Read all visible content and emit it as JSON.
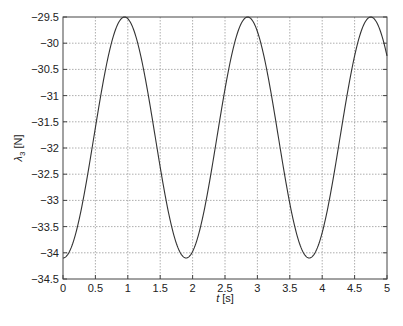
{
  "chart_data": {
    "type": "line",
    "title": "",
    "xlabel": "t [s]",
    "ylabel": "λ3 [N]",
    "xlim": [
      0,
      5
    ],
    "ylim": [
      -34.5,
      -29.5
    ],
    "grid": true,
    "legend": null,
    "x_ticks": [
      "0",
      "0.5",
      "1",
      "1.5",
      "2",
      "2.5",
      "3",
      "3.5",
      "4",
      "4.5",
      "5"
    ],
    "y_ticks": [
      "-29.5",
      "-30",
      "-30.5",
      "-31",
      "-31.5",
      "-32",
      "-32.5",
      "-33",
      "-33.5",
      "-34",
      "-34.5"
    ],
    "series": [
      {
        "name": "lambda3",
        "color": "#333333",
        "model": {
          "mean": -31.8,
          "amplitude": 2.3,
          "period": 1.9,
          "phase_min_at": 0.0
        },
        "x": [
          0,
          0.25,
          0.5,
          0.75,
          0.95,
          1.2,
          1.45,
          1.7,
          1.9,
          2.15,
          2.4,
          2.65,
          2.85,
          3.1,
          3.35,
          3.6,
          3.8,
          4.05,
          4.3,
          4.55,
          4.75,
          5.0
        ],
        "values": [
          -34.1,
          -33.3,
          -31.6,
          -30.1,
          -29.5,
          -30.0,
          -31.6,
          -33.3,
          -34.1,
          -33.5,
          -31.8,
          -30.1,
          -29.5,
          -30.0,
          -31.7,
          -33.4,
          -34.1,
          -33.4,
          -31.7,
          -30.0,
          -29.5,
          -30.15
        ]
      }
    ]
  },
  "axes": {
    "xlabel_italic": "t",
    "xlabel_unit": " [s]",
    "ylabel_symbol": "λ",
    "ylabel_sub": "3",
    "ylabel_unit": " [N]"
  }
}
